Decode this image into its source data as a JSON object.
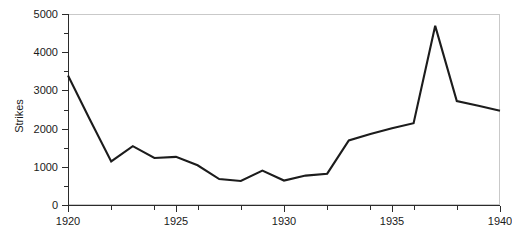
{
  "chart_data": {
    "type": "line",
    "title": "",
    "subtitle": "",
    "xlabel": "",
    "ylabel": "Strikes",
    "x": [
      1920,
      1921,
      1922,
      1923,
      1924,
      1925,
      1926,
      1927,
      1928,
      1929,
      1930,
      1931,
      1932,
      1933,
      1934,
      1935,
      1936,
      1937,
      1938,
      1939,
      1940
    ],
    "values": [
      3390,
      2250,
      1140,
      1540,
      1230,
      1260,
      1040,
      680,
      630,
      900,
      640,
      770,
      820,
      1690,
      1860,
      2010,
      2140,
      4690,
      2720,
      2600,
      2470
    ],
    "series": [
      {
        "name": "Strikes",
        "values": [
          3390,
          2250,
          1140,
          1540,
          1230,
          1260,
          1040,
          680,
          630,
          900,
          640,
          770,
          820,
          1690,
          1860,
          2010,
          2140,
          4690,
          2720,
          2600,
          2470
        ]
      }
    ],
    "xlim": [
      1920,
      1940
    ],
    "ylim": [
      0,
      5000
    ],
    "x_ticks_major": [
      1920,
      1925,
      1930,
      1935,
      1940
    ],
    "x_ticks_minor": [
      1922,
      1924,
      1926,
      1928,
      1932,
      1934,
      1936,
      1938
    ],
    "y_ticks_major": [
      0,
      1000,
      2000,
      3000,
      4000,
      5000
    ],
    "y_ticks_minor": [
      500,
      1500,
      2500,
      3500,
      4500
    ],
    "x_tick_labels": [
      "1920",
      "1925",
      "1930",
      "1935",
      "1940"
    ],
    "y_tick_labels": [
      "0",
      "1000",
      "2000",
      "3000",
      "4000",
      "5000"
    ],
    "grid": false,
    "legend": false,
    "legend_position": "none",
    "line_color": "#1c1c1c",
    "frame_color": "#c9c9c9",
    "axis_color": "#2b2b2b",
    "background_color": "#ffffff"
  }
}
